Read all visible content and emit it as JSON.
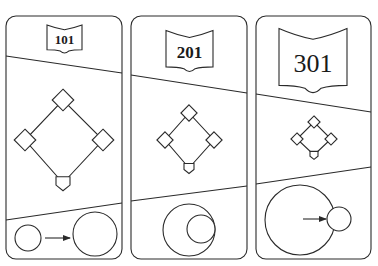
{
  "figure": {
    "width": 378,
    "height": 266,
    "stroke_color": "#2a2a2a",
    "background": "#ffffff"
  },
  "panels": [
    {
      "id": "panel-101",
      "label": "101",
      "box": {
        "x": 6,
        "y": 16,
        "w": 116,
        "h": 243,
        "r": 10
      },
      "badge": {
        "x": 47,
        "y": 24,
        "w": 35,
        "h": 30,
        "font_size": 13
      },
      "top_divider": [
        [
          6,
          56
        ],
        [
          122,
          73
        ]
      ],
      "bottom_divider": [
        [
          6,
          220
        ],
        [
          122,
          203
        ]
      ],
      "diamond": {
        "second": [
          63,
          100
        ],
        "third": [
          25,
          140
        ],
        "first": [
          103,
          140
        ],
        "home": [
          63,
          183
        ],
        "base_size": 16,
        "home_size": 14
      },
      "circles": [
        {
          "role": "small-circle",
          "cx": 28,
          "cy": 238,
          "r": 13
        },
        {
          "role": "large-circle",
          "cx": 95,
          "cy": 234,
          "r": 22
        }
      ],
      "arrow": {
        "x1": 45,
        "y1": 238,
        "x2": 70,
        "y2": 238
      }
    },
    {
      "id": "panel-201",
      "label": "201",
      "box": {
        "x": 131,
        "y": 16,
        "w": 116,
        "h": 243,
        "r": 10
      },
      "badge": {
        "x": 166,
        "y": 29,
        "w": 47,
        "h": 44,
        "font_size": 17
      },
      "top_divider": [
        [
          131,
          75
        ],
        [
          247,
          93
        ]
      ],
      "bottom_divider": [
        [
          131,
          201
        ],
        [
          247,
          186
        ]
      ],
      "diamond": {
        "second": [
          189,
          113
        ],
        "third": [
          165,
          140
        ],
        "first": [
          214,
          140
        ],
        "home": [
          189,
          168
        ],
        "base_size": 12,
        "home_size": 10
      },
      "circles": [
        {
          "role": "large-circle",
          "cx": 189,
          "cy": 230,
          "r": 26
        },
        {
          "role": "small-circle",
          "cx": 201,
          "cy": 229,
          "r": 14
        }
      ],
      "arrow": null
    },
    {
      "id": "panel-301",
      "label": "301",
      "box": {
        "x": 256,
        "y": 16,
        "w": 115,
        "h": 243,
        "r": 10
      },
      "badge": {
        "x": 279,
        "y": 26,
        "w": 68,
        "h": 69,
        "font_size": 26
      },
      "top_divider": [
        [
          256,
          94
        ],
        [
          371,
          112
        ]
      ],
      "bottom_divider": [
        [
          256,
          184
        ],
        [
          371,
          167
        ]
      ],
      "diamond": {
        "second": [
          314,
          122
        ],
        "third": [
          297,
          139
        ],
        "first": [
          331,
          139
        ],
        "home": [
          314,
          155
        ],
        "base_size": 9,
        "home_size": 8
      },
      "circles": [
        {
          "role": "large-circle",
          "cx": 300,
          "cy": 220,
          "r": 35
        },
        {
          "role": "small-circle",
          "cx": 339,
          "cy": 219,
          "r": 12
        }
      ],
      "arrow": {
        "x1": 303,
        "y1": 219,
        "x2": 326,
        "y2": 219
      }
    }
  ]
}
